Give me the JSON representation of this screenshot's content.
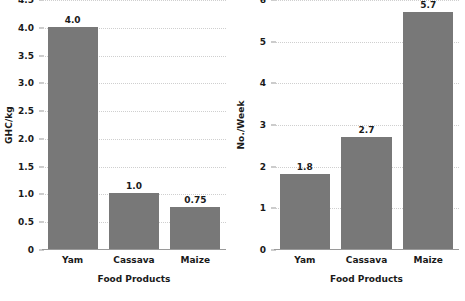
{
  "chart_data": [
    {
      "type": "bar",
      "panel": "left",
      "title": "",
      "categories": [
        "Yam",
        "Cassava",
        "Maize"
      ],
      "values": [
        4.0,
        1.0,
        0.75
      ],
      "value_labels": [
        "4.0",
        "1.0",
        "0.75"
      ],
      "xlabel": "Food Products",
      "ylabel": "GHC/kg",
      "ylim": [
        0,
        4.5
      ],
      "yticks": [
        0,
        0.5,
        1.0,
        1.5,
        2.0,
        2.5,
        3.0,
        3.5,
        4.0,
        4.5
      ],
      "ytick_labels": [
        "0",
        "0.5",
        "1.0",
        "1.5",
        "2.0",
        "2.5",
        "3.0",
        "3.5",
        "4.0",
        "4.5"
      ],
      "grid": true,
      "legend": "none",
      "bar_color": "#787878",
      "grid_color": "#cfcfcf",
      "axis_color": "#9a9a9a"
    },
    {
      "type": "bar",
      "panel": "right",
      "title": "",
      "categories": [
        "Yam",
        "Cassava",
        "Maize"
      ],
      "values": [
        1.8,
        2.7,
        5.7
      ],
      "value_labels": [
        "1.8",
        "2.7",
        "5.7"
      ],
      "xlabel": "Food Products",
      "ylabel": "No./Week",
      "ylim": [
        0,
        6
      ],
      "yticks": [
        0,
        1,
        2,
        3,
        4,
        5,
        6
      ],
      "ytick_labels": [
        "0",
        "1",
        "2",
        "3",
        "4",
        "5",
        "6"
      ],
      "grid": true,
      "legend": "none",
      "bar_color": "#787878",
      "grid_color": "#cfcfcf",
      "axis_color": "#9a9a9a"
    }
  ]
}
